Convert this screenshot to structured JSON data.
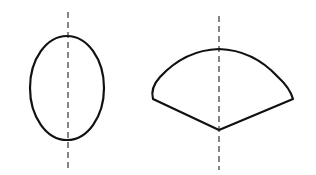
{
  "diagram": {
    "stroke_color": "#111111",
    "background": "#ffffff",
    "shapes": [
      {
        "name": "ellipse",
        "cx": 67,
        "cy": 88,
        "rx": 37,
        "ry": 52,
        "axis": {
          "x": 68,
          "y1": 12,
          "y2": 170,
          "style": "dashed"
        }
      },
      {
        "name": "fan-sector",
        "apex": [
          219,
          130
        ],
        "left_corner": [
          153,
          99
        ],
        "right_corner": [
          293,
          99
        ],
        "arc_top_y": 49,
        "axis": {
          "x": 219,
          "y1": 16,
          "y2": 170,
          "style": "dashed"
        }
      }
    ]
  }
}
